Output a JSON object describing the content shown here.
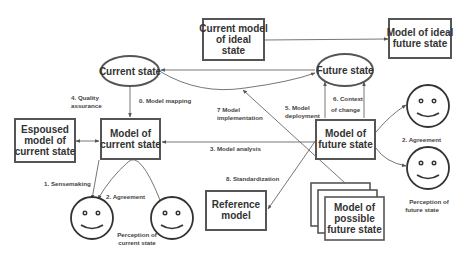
{
  "diagram": {
    "nodes": {
      "current_state": "Current state",
      "future_state": "Future state",
      "current_model_ideal": [
        "Current model",
        "of ideal",
        "state"
      ],
      "model_ideal_future": [
        "Model of ideal",
        "future state"
      ],
      "espoused_model": [
        "Espoused",
        "model of",
        "current state"
      ],
      "model_current_state": [
        "Model of",
        "current state"
      ],
      "model_future_state": [
        "Model of",
        "future state"
      ],
      "reference_model": [
        "Reference",
        "model"
      ],
      "model_possible_future": [
        "Model of",
        "possible",
        "future state"
      ]
    },
    "edges": {
      "quality_assurance": [
        "4. Quality",
        "assurance"
      ],
      "model_mapping": "0. Model mapping",
      "model_implementation": [
        "7 Model",
        "implementation"
      ],
      "model_deployment": [
        "5. Model",
        "deployment"
      ],
      "context_of_change": [
        "6. Context",
        "of change"
      ],
      "model_analysis": "3. Model analysis",
      "standardization": "8. Standardization",
      "sensemaking": "1. Sensemaking",
      "agreement_left": "2. Agreement",
      "agreement_right": "2. Agreement"
    },
    "faces": {
      "perception_current": [
        "Perception of",
        "current state"
      ],
      "perception_future": [
        "Perception of",
        "future state"
      ]
    }
  }
}
